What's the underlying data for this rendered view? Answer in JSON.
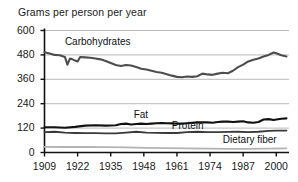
{
  "chart_data": {
    "type": "line",
    "title": "Grams per person per year",
    "xlabel": "",
    "ylabel": "Grams per person per year",
    "ylim": [
      0,
      600
    ],
    "xlim": [
      1909,
      2005
    ],
    "yticks": [
      0,
      120,
      240,
      360,
      480,
      600
    ],
    "xticks": [
      1909,
      1922,
      1935,
      1948,
      1961,
      1974,
      1987,
      2000
    ],
    "grid": "horizontal",
    "legend_position": "inline-annotations",
    "series": [
      {
        "name": "Carbohydrates",
        "color": "#4d4d4d",
        "label_x": 1917,
        "label_y": 545,
        "x": [
          1909,
          1911,
          1913,
          1915,
          1917,
          1918,
          1919,
          1920,
          1921,
          1922,
          1923,
          1925,
          1927,
          1929,
          1931,
          1933,
          1935,
          1937,
          1939,
          1941,
          1943,
          1945,
          1947,
          1949,
          1951,
          1953,
          1955,
          1957,
          1959,
          1961,
          1963,
          1965,
          1967,
          1969,
          1971,
          1973,
          1975,
          1977,
          1979,
          1981,
          1983,
          1985,
          1987,
          1989,
          1991,
          1993,
          1995,
          1997,
          1999,
          2000,
          2002,
          2004
        ],
        "values": [
          493,
          487,
          480,
          478,
          470,
          432,
          462,
          458,
          452,
          448,
          470,
          468,
          466,
          462,
          458,
          450,
          440,
          430,
          425,
          430,
          428,
          420,
          412,
          408,
          402,
          396,
          392,
          385,
          378,
          372,
          370,
          374,
          372,
          375,
          388,
          384,
          382,
          388,
          392,
          390,
          402,
          420,
          432,
          448,
          456,
          462,
          472,
          480,
          492,
          488,
          478,
          472
        ]
      },
      {
        "name": "Fat",
        "color": "#111111",
        "label_x": 1944,
        "label_y": 182,
        "x": [
          1909,
          1913,
          1917,
          1921,
          1925,
          1929,
          1933,
          1937,
          1939,
          1941,
          1943,
          1945,
          1947,
          1949,
          1951,
          1953,
          1955,
          1957,
          1959,
          1961,
          1963,
          1965,
          1967,
          1969,
          1971,
          1973,
          1975,
          1977,
          1979,
          1981,
          1983,
          1985,
          1987,
          1989,
          1991,
          1993,
          1995,
          1997,
          1999,
          2000,
          2002,
          2004
        ],
        "values": [
          124,
          124,
          122,
          126,
          132,
          134,
          132,
          134,
          140,
          142,
          138,
          140,
          142,
          140,
          142,
          144,
          145,
          144,
          143,
          142,
          142,
          144,
          146,
          148,
          149,
          148,
          146,
          150,
          152,
          152,
          150,
          152,
          154,
          148,
          146,
          150,
          162,
          164,
          160,
          162,
          166,
          168
        ]
      },
      {
        "name": "Protein",
        "color": "#3a3a3a",
        "label_x": 1959,
        "label_y": 128,
        "x": [
          1909,
          1913,
          1917,
          1921,
          1925,
          1929,
          1933,
          1937,
          1941,
          1945,
          1949,
          1953,
          1957,
          1961,
          1965,
          1969,
          1973,
          1977,
          1981,
          1985,
          1989,
          1993,
          1997,
          2000,
          2002,
          2004
        ],
        "values": [
          100,
          102,
          98,
          96,
          95,
          95,
          94,
          94,
          98,
          102,
          98,
          97,
          96,
          96,
          100,
          102,
          100,
          100,
          101,
          102,
          100,
          102,
          106,
          108,
          108,
          108
        ]
      },
      {
        "name": "Dietary fiber",
        "color": "#b3b3b3",
        "label_x": 1979,
        "label_y": 60,
        "x": [
          1909,
          1917,
          1925,
          1933,
          1941,
          1949,
          1957,
          1965,
          1973,
          1981,
          1989,
          1997,
          2004
        ],
        "values": [
          28,
          27,
          27,
          26,
          25,
          23,
          22,
          20,
          19,
          18,
          18,
          19,
          20
        ]
      }
    ]
  }
}
